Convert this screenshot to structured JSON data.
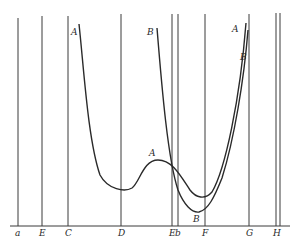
{
  "diagram": {
    "baseline_y": 226,
    "verticals": [
      {
        "label": "a",
        "x": 18,
        "top": 18
      },
      {
        "label": "E",
        "x": 42,
        "top": 16
      },
      {
        "label": "C",
        "x": 68,
        "top": 16
      },
      {
        "label": "D",
        "x": 121,
        "top": 14
      },
      {
        "label": "E",
        "x": 172,
        "top": 14
      },
      {
        "label": "b",
        "x": 178,
        "top": 14
      },
      {
        "label": "F",
        "x": 205,
        "top": 14
      },
      {
        "label": "G",
        "x": 249,
        "top": 14
      },
      {
        "label": "H",
        "x": 276,
        "top": 13
      },
      {
        "label": "",
        "x": 280,
        "top": 13
      }
    ],
    "axis_labels": [
      "a",
      "E",
      "C",
      "D",
      "E",
      "b",
      "F",
      "G",
      "H"
    ],
    "curve_labels": [
      {
        "text": "A",
        "x": 71,
        "y": 35
      },
      {
        "text": "B",
        "x": 147,
        "y": 35
      },
      {
        "text": "A",
        "x": 149,
        "y": 156
      },
      {
        "text": "B",
        "x": 193,
        "y": 222
      },
      {
        "text": "A",
        "x": 232,
        "y": 32
      },
      {
        "text": "B",
        "x": 240,
        "y": 60
      }
    ],
    "curves": {
      "A": "M79,24 C84,70 88,140 100,175 C108,190 125,192 132,188 C140,182 143,160 158,160 C172,160 180,175 190,190 C196,198 205,200 212,192 C225,170 240,100 246,23",
      "B": "M157,28 C162,90 168,160 178,190 C184,205 192,213 199,212 C208,210 214,198 222,178 C234,140 244,80 248,30"
    },
    "line_color": "#2a2a2a",
    "background": "#ffffff"
  }
}
